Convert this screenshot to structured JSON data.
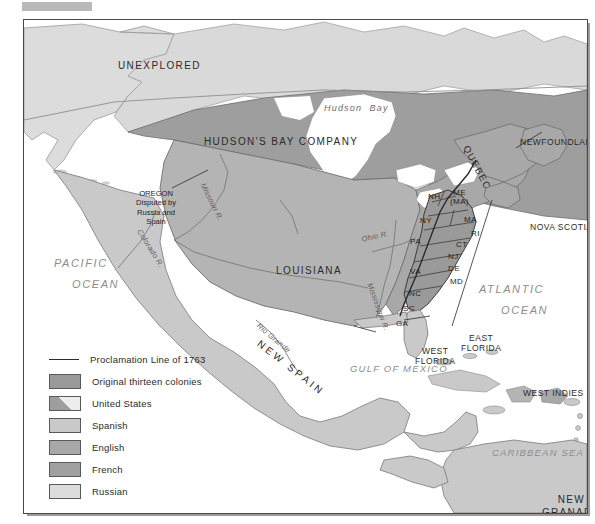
{
  "map": {
    "title": "North America 1763 — Colonial Claims",
    "colors": {
      "ocean": "#ffffff",
      "land_light": "#d9d9d9",
      "spanish": "#c9c9c9",
      "english": "#a8a8a8",
      "french": "#b4b4b4",
      "russian": "#dcdcdc",
      "colonies": "#9a9a9a",
      "hudsons_bay": "#9e9e9e",
      "border": "#4a4a4a",
      "text": "#2b2b2b",
      "ocean_text": "#8d8d8d"
    },
    "territories": [
      {
        "id": "unexplored",
        "label": "UNEXPLORED"
      },
      {
        "id": "hudsons-bay-company",
        "label": "HUDSON'S BAY COMPANY"
      },
      {
        "id": "louisiana",
        "label": "LOUISIANA"
      },
      {
        "id": "new-spain",
        "label": "NEW SPAIN"
      },
      {
        "id": "quebec",
        "label": "QUEBEC"
      },
      {
        "id": "newfoundland",
        "label": "NEWFOUNDLAND"
      },
      {
        "id": "nova-scotia",
        "label": "NOVA SCOTIA"
      },
      {
        "id": "west-florida",
        "label": "WEST\nFLORIDA"
      },
      {
        "id": "east-florida",
        "label": "EAST\nFLORIDA"
      },
      {
        "id": "west-indies",
        "label": "WEST INDIES"
      },
      {
        "id": "new-granada",
        "label": "NEW\nGRANADA"
      }
    ],
    "oregon_note": "OREGON\nDisputed by\nRussia and\nSpain",
    "waters": [
      {
        "id": "pacific-ocean",
        "line1": "PACIFIC",
        "line2": "OCEAN"
      },
      {
        "id": "atlantic-ocean",
        "line1": "ATLANTIC",
        "line2": "OCEAN"
      },
      {
        "id": "gulf-of-mexico",
        "label": "GULF OF MEXICO"
      },
      {
        "id": "caribbean-sea",
        "label": "CARIBBEAN SEA"
      },
      {
        "id": "hudson-bay",
        "label": "Hudson  Bay"
      }
    ],
    "rivers": [
      {
        "id": "missouri-river",
        "label": "Missouri R."
      },
      {
        "id": "colorado-river",
        "label": "Colorado R."
      },
      {
        "id": "mississippi-river",
        "label": "Mississippi R."
      },
      {
        "id": "ohio-river",
        "label": "Ohio R."
      },
      {
        "id": "rio-grande",
        "label": "Rio Grande"
      }
    ],
    "colonies": [
      {
        "id": "nh",
        "label": "NH"
      },
      {
        "id": "me-ma",
        "label": "ME\n(MA)"
      },
      {
        "id": "ny",
        "label": "NY"
      },
      {
        "id": "ma",
        "label": "MA"
      },
      {
        "id": "ri",
        "label": "RI"
      },
      {
        "id": "ct",
        "label": "CT"
      },
      {
        "id": "pa",
        "label": "PA"
      },
      {
        "id": "nj",
        "label": "NJ"
      },
      {
        "id": "de",
        "label": "DE"
      },
      {
        "id": "md",
        "label": "MD"
      },
      {
        "id": "va",
        "label": "VA"
      },
      {
        "id": "nc",
        "label": "NC"
      },
      {
        "id": "sc",
        "label": "SC"
      },
      {
        "id": "ga",
        "label": "GA"
      }
    ]
  },
  "legend": {
    "items": [
      {
        "id": "proclamation-line",
        "label": "Proclamation Line of 1763",
        "swatch": "line",
        "color": "#2b2b2b"
      },
      {
        "id": "original-thirteen-colonies",
        "label": "Original thirteen colonies",
        "swatch": "fill",
        "color": "#9a9a9a"
      },
      {
        "id": "united-states",
        "label": "United States",
        "swatch": "split",
        "color": "#b0b0b0"
      },
      {
        "id": "spanish",
        "label": "Spanish",
        "swatch": "fill",
        "color": "#c9c9c9"
      },
      {
        "id": "english",
        "label": "English",
        "swatch": "fill",
        "color": "#a8a8a8"
      },
      {
        "id": "french",
        "label": "French",
        "swatch": "fill",
        "color": "#a0a0a0"
      },
      {
        "id": "russian",
        "label": "Russian",
        "swatch": "fill",
        "color": "#dcdcdc"
      }
    ]
  }
}
